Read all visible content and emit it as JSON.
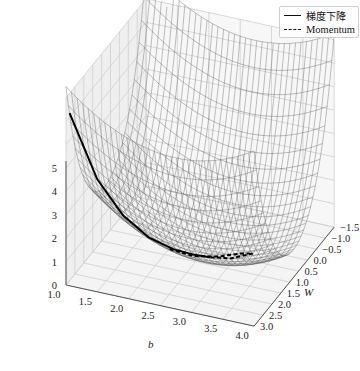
{
  "chart_data": {
    "type": "surface3d",
    "title": "",
    "xlabel": "b",
    "ylabel": "W",
    "zlabel": "",
    "x_ticks": [
      "1.0",
      "1.5",
      "2.0",
      "2.5",
      "3.0",
      "3.5",
      "4.0"
    ],
    "y_ticks": [
      "-1.5",
      "-1.0",
      "-0.5",
      "0.0",
      "0.5",
      "1.0",
      "1.5",
      "2.0",
      "2.5",
      "3.0"
    ],
    "z_ticks": [
      "0",
      "1",
      "2",
      "3",
      "4",
      "5"
    ],
    "xlim": [
      1.0,
      4.0
    ],
    "ylim": [
      -1.5,
      3.0
    ],
    "zlim": [
      0,
      5
    ],
    "surface": "wireframe loss surface (convex bowl), minimum near b≈2.8, W≈0.8",
    "legend": {
      "position": "upper right",
      "entries": [
        {
          "label": "梯度下降",
          "style": "solid",
          "color": "#000000"
        },
        {
          "label": "Momentum",
          "style": "dashed",
          "color": "#000000"
        }
      ]
    },
    "series": [
      {
        "name": "梯度下降",
        "style": "solid",
        "path_b": [
          1.0,
          1.3,
          1.6,
          1.9,
          2.2,
          2.5,
          2.7
        ],
        "path_W": [
          2.8,
          2.3,
          1.9,
          1.5,
          1.2,
          1.0,
          0.9
        ]
      },
      {
        "name": "Momentum",
        "style": "dashed",
        "path_b": [
          2.2,
          2.5,
          2.8,
          3.1,
          3.3,
          3.0,
          2.7
        ],
        "path_W": [
          1.4,
          1.1,
          0.8,
          0.6,
          0.6,
          0.8,
          0.9
        ]
      }
    ]
  },
  "legend": {
    "entry1": "梯度下降",
    "entry2": "Momentum"
  },
  "axes": {
    "x_label": "b",
    "y_label": "W"
  }
}
